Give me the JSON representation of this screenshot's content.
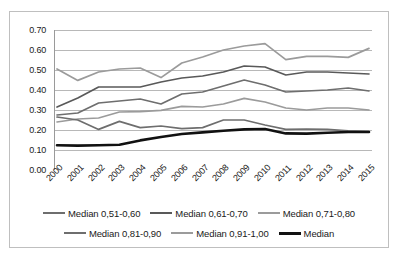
{
  "chart_data": {
    "type": "line",
    "title": "",
    "xlabel": "",
    "ylabel": "",
    "grid": true,
    "legend_position": "bottom",
    "ylim": [
      0.0,
      0.7
    ],
    "ytick_labels": [
      "0.70",
      "0.60",
      "0.50",
      "0.40",
      "0.30",
      "0.20",
      "0.10",
      "0.00"
    ],
    "ytick_values": [
      0.7,
      0.6,
      0.5,
      0.4,
      0.3,
      0.2,
      0.1,
      0.0
    ],
    "categories": [
      "2000",
      "2001",
      "2002",
      "2003",
      "2004",
      "2005",
      "2006",
      "2007",
      "2008",
      "2009",
      "2010",
      "2011",
      "2012",
      "2013",
      "2014",
      "2015"
    ],
    "series": [
      {
        "name": "Median 0,51-0,60",
        "color": "#6e6e6e",
        "width": 1.7,
        "values": [
          0.275,
          0.285,
          0.335,
          0.345,
          0.355,
          0.33,
          0.38,
          0.39,
          0.42,
          0.45,
          0.425,
          0.39,
          0.395,
          0.4,
          0.41,
          0.395
        ]
      },
      {
        "name": "Median 0,61-0,70",
        "color": "#595959",
        "width": 1.7,
        "values": [
          0.315,
          0.36,
          0.415,
          0.415,
          0.415,
          0.44,
          0.46,
          0.47,
          0.49,
          0.52,
          0.515,
          0.475,
          0.49,
          0.49,
          0.485,
          0.48
        ]
      },
      {
        "name": "Median 0,71-0,80",
        "color": "#9b9b9b",
        "width": 1.7,
        "values": [
          0.24,
          0.255,
          0.26,
          0.29,
          0.292,
          0.298,
          0.318,
          0.315,
          0.33,
          0.358,
          0.34,
          0.31,
          0.3,
          0.31,
          0.31,
          0.3
        ]
      },
      {
        "name": "Median 0,81-0,90",
        "color": "#6e6e6e",
        "width": 1.7,
        "values": [
          0.265,
          0.25,
          0.203,
          0.243,
          0.212,
          0.22,
          0.207,
          0.212,
          0.25,
          0.25,
          0.225,
          0.203,
          0.205,
          0.203,
          0.196,
          0.192
        ]
      },
      {
        "name": "Median 0,91-1,00",
        "color": "#9b9b9b",
        "width": 1.7,
        "values": [
          0.505,
          0.448,
          0.49,
          0.505,
          0.51,
          0.462,
          0.535,
          0.565,
          0.6,
          0.62,
          0.632,
          0.552,
          0.568,
          0.568,
          0.563,
          0.608
        ]
      },
      {
        "name": "Median",
        "color": "#111111",
        "width": 2.6,
        "values": [
          0.124,
          0.122,
          0.124,
          0.126,
          0.148,
          0.165,
          0.18,
          0.188,
          0.196,
          0.203,
          0.205,
          0.183,
          0.182,
          0.186,
          0.19,
          0.19
        ]
      }
    ]
  }
}
